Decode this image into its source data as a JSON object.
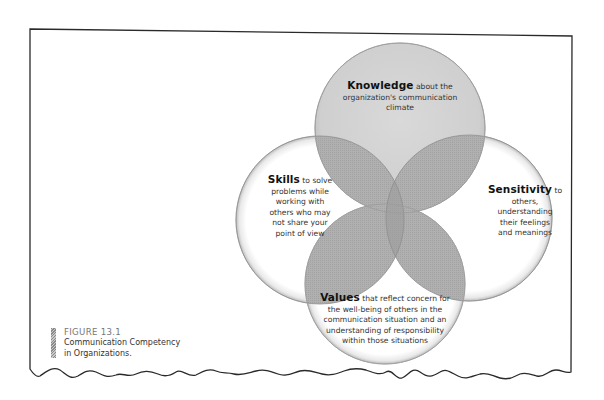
{
  "figure": {
    "number_label": "FIGURE 13.1",
    "title_line1": "Communication Competency",
    "title_line2": "in Organizations."
  },
  "circles": [
    {
      "id": "knowledge",
      "keyword": "Knowledge",
      "text_lines": [
        "about the",
        "organization's communication",
        "climate"
      ],
      "position": "top"
    },
    {
      "id": "skills",
      "keyword": "Skills",
      "text_lines": [
        "to solve",
        "problems while",
        "working with",
        "others who may",
        "not share your",
        "point of view"
      ],
      "position": "left"
    },
    {
      "id": "sensitivity",
      "keyword": "Sensitivity",
      "text_lines": [
        "to",
        "others,",
        "understanding",
        "their feelings",
        "and meanings"
      ],
      "position": "right"
    },
    {
      "id": "values",
      "keyword": "Values",
      "text_lines": [
        "that reflect concern for",
        "the well-being of others in the",
        "communication situation and an",
        "understanding of responsibility",
        "within those situations"
      ],
      "position": "bottom"
    }
  ],
  "colors": {
    "frame": "#2a2a2a",
    "circle_fill": "#ffffff",
    "overlap_fill": "#a9a9a9",
    "top_circle_fill": "#d4d4d4",
    "circle_rim": "#b8b8b8"
  }
}
